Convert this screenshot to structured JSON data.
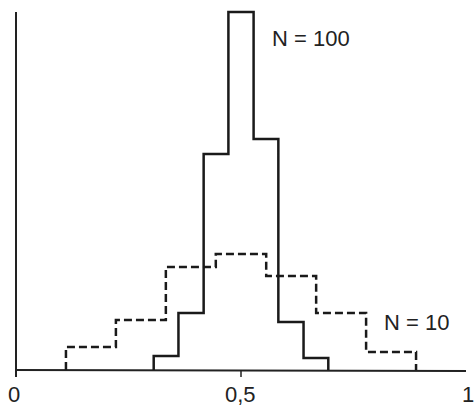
{
  "chart_data": {
    "type": "bar",
    "title": "",
    "xlabel": "",
    "ylabel": "",
    "xlim": [
      0,
      1
    ],
    "x_ticks": [
      "0",
      "0,5",
      "1"
    ],
    "grid": false,
    "series": [
      {
        "name": "N = 100",
        "style": "solid",
        "bin_edges": [
          0.306,
          0.361,
          0.417,
          0.472,
          0.528,
          0.583,
          0.639,
          0.694
        ],
        "values": [
          14,
          57,
          216,
          358,
          231,
          48,
          12
        ]
      },
      {
        "name": "N = 10",
        "style": "dashed",
        "bin_edges": [
          0.111,
          0.222,
          0.333,
          0.444,
          0.556,
          0.667,
          0.778,
          0.889
        ],
        "values": [
          23,
          50,
          103,
          116,
          94,
          57,
          18
        ]
      }
    ],
    "annotations": [
      "N = 100",
      "N = 10"
    ]
  },
  "labels": {
    "n100": "N = 100",
    "n10": "N = 10",
    "tick0": "0",
    "tick05": "0,5",
    "tick1": "1"
  }
}
